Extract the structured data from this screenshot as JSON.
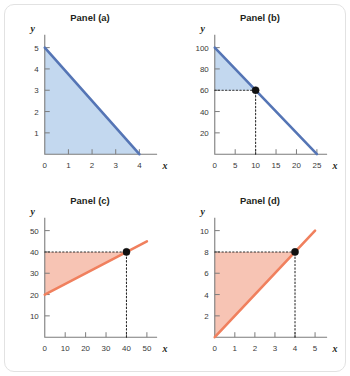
{
  "figure": {
    "background_color": "#ffffff",
    "card_border_color": "#e2e2e2",
    "blue_line_color": "#5575b5",
    "blue_fill_color": "#c3d8ef",
    "orange_line_color": "#f0805e",
    "orange_fill_color": "#f7c4b4",
    "axis_color": "#7c7c7c",
    "marker_color": "#111111",
    "x_axis_name": "x",
    "y_axis_name": "y"
  },
  "chart_data": [
    {
      "type": "area",
      "title": "Panel (a)",
      "xlabel": "x",
      "ylabel": "y",
      "xlim": [
        0,
        4.75
      ],
      "ylim": [
        0,
        5.6
      ],
      "xticks": [
        0,
        1,
        2,
        3,
        4
      ],
      "yticks": [
        1,
        2,
        3,
        4,
        5
      ],
      "origin_label": "0",
      "grid": false,
      "line_color": "#5575b5",
      "fill_color": "#c3d8ef",
      "series": [
        {
          "name": "budget line",
          "x": [
            0,
            4
          ],
          "y": [
            5,
            0
          ]
        }
      ],
      "shaded_region": "triangle below line, bounded by axes",
      "points": [],
      "guides": []
    },
    {
      "type": "area",
      "title": "Panel (b)",
      "xlabel": "x",
      "ylabel": "y",
      "xlim": [
        0,
        27.5
      ],
      "ylim": [
        0,
        112
      ],
      "xticks": [
        0,
        5,
        10,
        15,
        20,
        25
      ],
      "yticks": [
        20,
        40,
        60,
        80,
        100
      ],
      "origin_label": "0",
      "grid": false,
      "line_color": "#5575b5",
      "fill_color": "#c3d8ef",
      "series": [
        {
          "name": "budget line",
          "x": [
            0,
            25
          ],
          "y": [
            100,
            0
          ]
        }
      ],
      "shaded_region": "triangle bounded by y-axis, line, and y = 60",
      "points": [
        {
          "x": 10,
          "y": 60
        }
      ],
      "guides": [
        {
          "type": "horizontal",
          "from_x": 0,
          "to_x": 10,
          "y": 60
        },
        {
          "type": "vertical",
          "x": 10,
          "from_y": 0,
          "to_y": 60
        }
      ]
    },
    {
      "type": "area",
      "title": "Panel (c)",
      "xlabel": "x",
      "ylabel": "y",
      "xlim": [
        0,
        55
      ],
      "ylim": [
        0,
        56
      ],
      "xticks": [
        0,
        10,
        20,
        30,
        40,
        50
      ],
      "yticks": [
        10,
        20,
        30,
        40,
        50
      ],
      "origin_label": "0",
      "grid": false,
      "line_color": "#f0805e",
      "fill_color": "#f7c4b4",
      "series": [
        {
          "name": "constraint line",
          "x": [
            0,
            50
          ],
          "y": [
            20,
            45
          ]
        }
      ],
      "shaded_region": "region between line and y = 40, bounded by y-axis",
      "points": [
        {
          "x": 40,
          "y": 40
        }
      ],
      "guides": [
        {
          "type": "horizontal",
          "from_x": 0,
          "to_x": 40,
          "y": 40
        },
        {
          "type": "vertical",
          "x": 40,
          "from_y": 0,
          "to_y": 40
        }
      ]
    },
    {
      "type": "area",
      "title": "Panel (d)",
      "xlabel": "x",
      "ylabel": "y",
      "xlim": [
        0,
        5.6
      ],
      "ylim": [
        0,
        11.2
      ],
      "xticks": [
        0,
        1,
        2,
        3,
        4,
        5
      ],
      "yticks": [
        2,
        4,
        6,
        8,
        10
      ],
      "origin_label": "0",
      "grid": false,
      "line_color": "#f0805e",
      "fill_color": "#f7c4b4",
      "series": [
        {
          "name": "constraint line",
          "x": [
            0,
            5
          ],
          "y": [
            0,
            10
          ]
        }
      ],
      "shaded_region": "region between line and y = 8, bounded by y-axis",
      "points": [
        {
          "x": 4,
          "y": 8
        }
      ],
      "guides": [
        {
          "type": "horizontal",
          "from_x": 0,
          "to_x": 4,
          "y": 8
        },
        {
          "type": "vertical",
          "x": 4,
          "from_y": 0,
          "to_y": 8
        }
      ]
    }
  ]
}
